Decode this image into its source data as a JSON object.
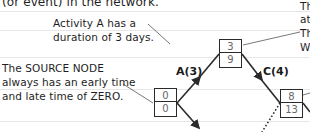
{
  "header": {
    "title_fragment": "(or event) in the network."
  },
  "annotations": {
    "activity_a": [
      "Activity A has a",
      "duration of 3 days."
    ],
    "source_node": [
      "The SOURCE NODE",
      "always has an early time",
      "and late time of ZERO."
    ],
    "right_top": [
      "Th",
      "at",
      "Th",
      "W"
    ]
  },
  "activities": [
    {
      "id": "A",
      "label": "A(3)",
      "duration": 3
    },
    {
      "id": "C",
      "label": "C(4)",
      "duration": 4
    }
  ],
  "nodes": [
    {
      "name": "source",
      "early": "0",
      "late": "0"
    },
    {
      "name": "node-after-a",
      "early": "3",
      "late": "9"
    },
    {
      "name": "node-after-c",
      "early": "8",
      "late": "13"
    }
  ],
  "colors": {
    "line": "#2a2a2a",
    "rule": "#e6e6e6",
    "number": "#666666"
  }
}
